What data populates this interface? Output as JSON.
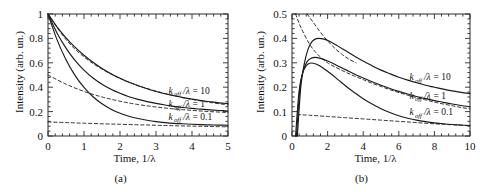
{
  "figure": {
    "panels": [
      {
        "caption": "(a)",
        "xlabel_prefix": "Time, 1/",
        "xlabel_symbol": "λ",
        "ylabel": "Intensity (arb. un.)"
      },
      {
        "caption": "(b)",
        "xlabel_prefix": "Time, 1/",
        "xlabel_symbol": "λ",
        "ylabel": "Intensity (arb. un.)"
      }
    ]
  },
  "chart_data": [
    {
      "type": "line",
      "panel": "(a)",
      "title": "",
      "xlabel": "Time, 1/λ",
      "ylabel": "Intensity (arb. un.)",
      "xlim": [
        0,
        5
      ],
      "ylim": [
        0,
        1
      ],
      "xticks": [
        0,
        1,
        2,
        3,
        4,
        5
      ],
      "xticklabels": [
        "0",
        "1",
        "2",
        "3",
        "4",
        "5"
      ],
      "yticks": [
        0,
        0.2,
        0.4,
        0.6,
        0.8,
        1
      ],
      "yticklabels": [
        "0",
        "0.2",
        "0.4",
        "0.6",
        "0.8",
        "1"
      ],
      "grid": false,
      "minor_ticks": true,
      "legend": "inline-annotations",
      "annotations": [
        {
          "text": "k_off/λ = 10",
          "x": 3.35,
          "y": 0.345
        },
        {
          "text": "k_off/λ = 1",
          "x": 3.35,
          "y": 0.235
        },
        {
          "text": "k_off/λ = 0.1",
          "x": 3.35,
          "y": 0.135
        }
      ],
      "series": [
        {
          "name": "k_off/λ = 10",
          "style": "solid",
          "x": [
            0,
            0.25,
            0.5,
            0.75,
            1,
            1.25,
            1.5,
            1.75,
            2,
            2.25,
            2.5,
            2.75,
            3,
            3.25,
            3.5,
            3.75,
            4,
            4.25,
            4.5,
            4.75,
            5
          ],
          "y": [
            1.0,
            0.895,
            0.805,
            0.728,
            0.662,
            0.604,
            0.554,
            0.511,
            0.473,
            0.44,
            0.412,
            0.387,
            0.365,
            0.346,
            0.33,
            0.315,
            0.302,
            0.291,
            0.281,
            0.272,
            0.265
          ]
        },
        {
          "name": "k_off/λ = 10 (asymptote)",
          "style": "dashed",
          "x": [
            0,
            0.5,
            1,
            1.5,
            2,
            2.5,
            3,
            3.5,
            4,
            4.5,
            5
          ],
          "y": [
            1.0,
            0.79,
            0.648,
            0.548,
            0.472,
            0.414,
            0.368,
            0.331,
            0.3,
            0.275,
            0.255
          ]
        },
        {
          "name": "k_off/λ = 1",
          "style": "solid",
          "x": [
            0,
            0.25,
            0.5,
            0.75,
            1,
            1.25,
            1.5,
            1.75,
            2,
            2.25,
            2.5,
            2.75,
            3,
            3.25,
            3.5,
            3.75,
            4,
            4.25,
            4.5,
            4.75,
            5
          ],
          "y": [
            1.0,
            0.845,
            0.72,
            0.62,
            0.54,
            0.475,
            0.424,
            0.383,
            0.35,
            0.322,
            0.3,
            0.282,
            0.267,
            0.254,
            0.243,
            0.234,
            0.226,
            0.22,
            0.214,
            0.209,
            0.205
          ]
        },
        {
          "name": "k_off/λ = 1 (asymptote)",
          "style": "dashed",
          "x": [
            0,
            0.5,
            1,
            1.5,
            2,
            2.5,
            3,
            3.5,
            4,
            4.5,
            5
          ],
          "y": [
            0.5,
            0.425,
            0.365,
            0.32,
            0.285,
            0.258,
            0.238,
            0.222,
            0.21,
            0.2,
            0.193
          ]
        },
        {
          "name": "k_off/λ = 0.1",
          "style": "solid",
          "x": [
            0,
            0.25,
            0.5,
            0.75,
            1,
            1.25,
            1.5,
            1.75,
            2,
            2.25,
            2.5,
            2.75,
            3,
            3.25,
            3.5,
            3.75,
            4,
            4.25,
            4.5,
            4.75,
            5
          ],
          "y": [
            1.0,
            0.79,
            0.625,
            0.497,
            0.398,
            0.322,
            0.264,
            0.22,
            0.187,
            0.162,
            0.143,
            0.129,
            0.118,
            0.11,
            0.104,
            0.1,
            0.096,
            0.093,
            0.091,
            0.089,
            0.088
          ]
        },
        {
          "name": "k_off/λ = 0.1 (asymptote)",
          "style": "dashed",
          "x": [
            0,
            0.5,
            1,
            1.5,
            2,
            2.5,
            3,
            3.5,
            4,
            4.5,
            5
          ],
          "y": [
            0.115,
            0.11,
            0.105,
            0.1,
            0.096,
            0.092,
            0.088,
            0.084,
            0.081,
            0.078,
            0.075
          ]
        }
      ]
    },
    {
      "type": "line",
      "panel": "(b)",
      "title": "",
      "xlabel": "Time, 1/λ",
      "ylabel": "Intensity (arb. un.)",
      "xlim": [
        0,
        10
      ],
      "ylim": [
        0,
        0.5
      ],
      "xticks": [
        0,
        2,
        4,
        6,
        8,
        10
      ],
      "xticklabels": [
        "0",
        "2",
        "4",
        "6",
        "8",
        "10"
      ],
      "yticks": [
        0,
        0.1,
        0.2,
        0.3,
        0.4,
        0.5
      ],
      "yticklabels": [
        "0",
        "0.1",
        "0.2",
        "0.3",
        "0.4",
        "0.5"
      ],
      "grid": false,
      "minor_ticks": true,
      "legend": "inline-annotations",
      "annotations": [
        {
          "text": "k_off/λ = 10",
          "x": 6.6,
          "y": 0.228
        },
        {
          "text": "k_off/λ = 1",
          "x": 6.6,
          "y": 0.152
        },
        {
          "text": "k_off/λ = 0.1",
          "x": 6.6,
          "y": 0.085
        }
      ],
      "series": [
        {
          "name": "k_off/λ = 10",
          "style": "solid",
          "x": [
            0.3,
            0.5,
            0.7,
            0.9,
            1.1,
            1.3,
            1.5,
            1.8,
            2.1,
            2.5,
            3,
            3.5,
            4,
            4.5,
            5,
            5.5,
            6,
            6.5,
            7,
            7.5,
            8,
            8.5,
            9,
            9.5,
            10
          ],
          "y": [
            0.0,
            0.205,
            0.3,
            0.355,
            0.385,
            0.397,
            0.4,
            0.397,
            0.388,
            0.372,
            0.35,
            0.328,
            0.307,
            0.288,
            0.27,
            0.255,
            0.241,
            0.229,
            0.218,
            0.208,
            0.2,
            0.192,
            0.185,
            0.179,
            0.174
          ]
        },
        {
          "name": "k_off/λ = 10 (asymptote)",
          "style": "dashed",
          "x": [
            0.85,
            1.2,
            1.6,
            2,
            2.4,
            2.8,
            3.2,
            3.6
          ],
          "y": [
            0.5,
            0.465,
            0.425,
            0.39,
            0.36,
            0.335,
            0.315,
            0.3
          ]
        },
        {
          "name": "k_off/λ = 1",
          "style": "solid",
          "x": [
            0.25,
            0.45,
            0.65,
            0.85,
            1.05,
            1.3,
            1.6,
            2,
            2.5,
            3,
            3.5,
            4,
            4.5,
            5,
            5.5,
            6,
            6.5,
            7,
            7.5,
            8,
            8.5,
            9,
            9.5,
            10
          ],
          "y": [
            0.0,
            0.2,
            0.272,
            0.305,
            0.318,
            0.322,
            0.318,
            0.307,
            0.29,
            0.272,
            0.254,
            0.238,
            0.222,
            0.208,
            0.195,
            0.183,
            0.172,
            0.162,
            0.153,
            0.145,
            0.138,
            0.131,
            0.125,
            0.12
          ]
        },
        {
          "name": "k_off/λ = 1 (asymptote)",
          "style": "dashed",
          "x": [
            0.2,
            0.5,
            1,
            1.5,
            2,
            2.5,
            3,
            3.5,
            4,
            4.5,
            5,
            5.5,
            6,
            6.5,
            7,
            7.5,
            8,
            8.5,
            9,
            9.5,
            10
          ],
          "y": [
            0.5,
            0.445,
            0.375,
            0.33,
            0.3,
            0.28,
            0.262,
            0.246,
            0.231,
            0.216,
            0.203,
            0.19,
            0.178,
            0.167,
            0.157,
            0.148,
            0.139,
            0.131,
            0.124,
            0.117,
            0.111
          ]
        },
        {
          "name": "k_off/λ = 0.1",
          "style": "solid",
          "x": [
            0.2,
            0.4,
            0.6,
            0.8,
            1,
            1.2,
            1.5,
            1.8,
            2.2,
            2.6,
            3,
            3.5,
            4,
            4.5,
            5,
            5.5,
            6,
            6.5,
            7,
            7.5,
            8,
            8.5,
            9,
            9.5,
            10
          ],
          "y": [
            0.0,
            0.185,
            0.258,
            0.288,
            0.298,
            0.298,
            0.29,
            0.276,
            0.254,
            0.23,
            0.206,
            0.178,
            0.153,
            0.131,
            0.112,
            0.096,
            0.083,
            0.073,
            0.065,
            0.059,
            0.054,
            0.05,
            0.047,
            0.045,
            0.043
          ]
        },
        {
          "name": "k_off/λ = 0.1 (asymptote)",
          "style": "dashed",
          "x": [
            0.3,
            1,
            2,
            3,
            4,
            5,
            6,
            7,
            8,
            9,
            10
          ],
          "y": [
            0.088,
            0.085,
            0.08,
            0.075,
            0.07,
            0.065,
            0.06,
            0.055,
            0.05,
            0.046,
            0.042
          ]
        }
      ]
    }
  ]
}
